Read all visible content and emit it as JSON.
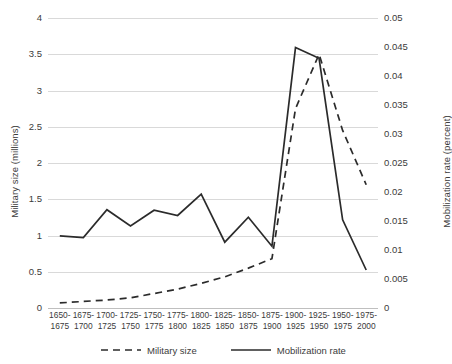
{
  "chart_data": {
    "type": "line",
    "title": "",
    "xlabel": "",
    "grid": true,
    "legend_position": "bottom",
    "categories": [
      "1650-1675",
      "1675-1700",
      "1700-1725",
      "1725-1750",
      "1750-1775",
      "1775-1800",
      "1800-1825",
      "1825-1850",
      "1850-1875",
      "1875-1900",
      "1900-1925",
      "1925-1950",
      "1950-1975",
      "1975-2000"
    ],
    "x_tick_labels": [
      {
        "top": "1650-",
        "bottom": "1675"
      },
      {
        "top": "1675-",
        "bottom": "1700"
      },
      {
        "top": "1700-",
        "bottom": "1725"
      },
      {
        "top": "1725-",
        "bottom": "1750"
      },
      {
        "top": "1750-",
        "bottom": "1775"
      },
      {
        "top": "1775-",
        "bottom": "1800"
      },
      {
        "top": "1800-",
        "bottom": "1825"
      },
      {
        "top": "1825-",
        "bottom": "1850"
      },
      {
        "top": "1850-",
        "bottom": "1875"
      },
      {
        "top": "1875-",
        "bottom": "1900"
      },
      {
        "top": "1900-",
        "bottom": "1925"
      },
      {
        "top": "1925-",
        "bottom": "1950"
      },
      {
        "top": "1950-",
        "bottom": "1975"
      },
      {
        "top": "1975-",
        "bottom": "2000"
      }
    ],
    "axes": {
      "left": {
        "label": "Military size (millions)",
        "min": 0,
        "max": 4,
        "step": 0.5,
        "ticks": [
          "0",
          "0.5",
          "1",
          "1.5",
          "2",
          "2.5",
          "3",
          "3.5",
          "4"
        ],
        "tick_values": [
          0,
          0.5,
          1,
          1.5,
          2,
          2.5,
          3,
          3.5,
          4
        ]
      },
      "right": {
        "label": "Mobilization rate (percent)",
        "min": 0,
        "max": 0.05,
        "step": 0.005,
        "ticks": [
          "0",
          "0.005",
          "0.01",
          "0.015",
          "0.02",
          "0.025",
          "0.03",
          "0.035",
          "0.04",
          "0.045",
          "0.05"
        ],
        "tick_values": [
          0,
          0.005,
          0.01,
          0.015,
          0.02,
          0.025,
          0.03,
          0.035,
          0.04,
          0.045,
          0.05
        ]
      }
    },
    "series": [
      {
        "name": "Military size",
        "axis": "left",
        "style": "dashed",
        "color": "#2b2b2b",
        "units": "millions",
        "values": [
          0.07,
          0.09,
          0.11,
          0.14,
          0.2,
          0.26,
          0.34,
          0.43,
          0.55,
          0.68,
          2.75,
          3.5,
          2.45,
          1.7
        ]
      },
      {
        "name": "Mobilization rate",
        "axis": "right",
        "style": "solid",
        "color": "#2b2b2b",
        "units": "percent",
        "values": [
          0.01245,
          0.01215,
          0.01695,
          0.01415,
          0.01685,
          0.01595,
          0.01965,
          0.01135,
          0.01565,
          0.01065,
          0.0449,
          0.04305,
          0.0152,
          0.00655
        ]
      }
    ]
  },
  "legend": {
    "items": [
      {
        "label": "Military size",
        "style": "dashed"
      },
      {
        "label": "Mobilization rate",
        "style": "solid"
      }
    ]
  }
}
